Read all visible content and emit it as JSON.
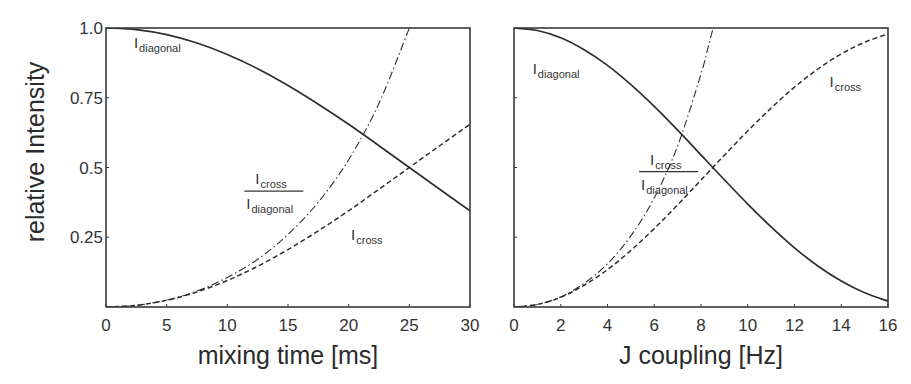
{
  "figure": {
    "ylabel": "relative Intensity",
    "colors": {
      "line": "#2e2e2e",
      "frame": "#3a3a3a",
      "background": "#ffffff"
    }
  },
  "chart_data": [
    {
      "type": "line",
      "title": "",
      "xlabel": "mixing time [ms]",
      "ylabel": "relative Intensity",
      "xlim": [
        0,
        30
      ],
      "ylim": [
        0,
        1.0
      ],
      "xticks": [
        0,
        5,
        10,
        15,
        20,
        25,
        30
      ],
      "xtick_labels": [
        "0",
        "5",
        "10",
        "15",
        "20",
        "25",
        "30"
      ],
      "yticks": [
        0.25,
        0.5,
        0.75,
        1.0
      ],
      "ytick_labels": [
        "0.25",
        "0.5",
        "0.75",
        "1.0"
      ],
      "grid": false,
      "legend": "inline labels",
      "series": [
        {
          "name": "I_diagonal",
          "style": "solid",
          "x": [
            0,
            2.5,
            5,
            7.5,
            10,
            12.5,
            15,
            17.5,
            20,
            22.5,
            25,
            27.5,
            30
          ],
          "y": [
            1.0,
            0.994,
            0.976,
            0.946,
            0.905,
            0.854,
            0.794,
            0.727,
            0.655,
            0.578,
            0.5,
            0.422,
            0.345
          ]
        },
        {
          "name": "I_cross",
          "style": "dashed",
          "x": [
            0,
            2.5,
            5,
            7.5,
            10,
            12.5,
            15,
            17.5,
            20,
            22.5,
            25,
            27.5,
            30
          ],
          "y": [
            0.0,
            0.006,
            0.024,
            0.054,
            0.095,
            0.146,
            0.206,
            0.273,
            0.345,
            0.422,
            0.5,
            0.578,
            0.655
          ]
        },
        {
          "name": "I_cross / I_diagonal",
          "style": "dashdot",
          "x": [
            0,
            2.5,
            5,
            7.5,
            10,
            12.5,
            15,
            17.5,
            20,
            22.5,
            25
          ],
          "y": [
            0.0,
            0.006,
            0.025,
            0.057,
            0.106,
            0.171,
            0.26,
            0.376,
            0.528,
            0.73,
            1.0
          ]
        }
      ],
      "annotations": [
        {
          "id": "diag",
          "text": "I",
          "sub": "diagonal",
          "x": 2.3,
          "y": 0.93
        },
        {
          "id": "cross",
          "text": "I",
          "sub": "cross",
          "x": 20.2,
          "y": 0.24
        },
        {
          "id": "ratio",
          "num": "I",
          "num_sub": "cross",
          "den": "I",
          "den_sub": "diagonal",
          "x": 11.4,
          "y": 0.415
        }
      ]
    },
    {
      "type": "line",
      "title": "",
      "xlabel": "J coupling [Hz]",
      "ylabel": "",
      "xlim": [
        0,
        16
      ],
      "ylim": [
        0,
        1.0
      ],
      "xticks": [
        0,
        2,
        4,
        6,
        8,
        10,
        12,
        14,
        16
      ],
      "xtick_labels": [
        "0",
        "2",
        "4",
        "6",
        "8",
        "10",
        "12",
        "14",
        "16"
      ],
      "yticks": [
        0.25,
        0.5,
        0.75,
        1.0
      ],
      "ytick_labels": [],
      "grid": false,
      "legend": "inline labels",
      "series": [
        {
          "name": "I_diagonal",
          "style": "solid",
          "x": [
            0,
            1,
            2,
            3,
            4,
            5,
            6,
            7,
            8,
            9,
            10,
            11,
            12,
            13,
            14,
            15,
            16
          ],
          "y": [
            1.0,
            0.991,
            0.965,
            0.922,
            0.866,
            0.797,
            0.719,
            0.634,
            0.545,
            0.456,
            0.369,
            0.287,
            0.212,
            0.147,
            0.093,
            0.051,
            0.021
          ]
        },
        {
          "name": "I_cross",
          "style": "dashed",
          "x": [
            0,
            1,
            2,
            3,
            4,
            5,
            6,
            7,
            8,
            9,
            10,
            11,
            12,
            13,
            14,
            15,
            16
          ],
          "y": [
            0.0,
            0.009,
            0.035,
            0.078,
            0.134,
            0.203,
            0.281,
            0.366,
            0.455,
            0.544,
            0.631,
            0.713,
            0.788,
            0.853,
            0.907,
            0.949,
            0.979
          ]
        },
        {
          "name": "I_cross / I_diagonal",
          "style": "dashdot",
          "x": [
            0,
            1,
            2,
            3,
            4,
            5,
            6,
            7,
            8,
            8.3
          ],
          "y": [
            0.0,
            0.009,
            0.036,
            0.085,
            0.155,
            0.255,
            0.391,
            0.577,
            0.835,
            0.93
          ]
        }
      ],
      "annotations": [
        {
          "id": "diag",
          "text": "I",
          "sub": "diagonal",
          "x": 0.8,
          "y": 0.835
        },
        {
          "id": "cross",
          "text": "I",
          "sub": "cross",
          "x": 13.5,
          "y": 0.79
        },
        {
          "id": "ratio",
          "num": "I",
          "num_sub": "cross",
          "den": "I",
          "den_sub": "diagonal",
          "x": 5.35,
          "y": 0.485
        }
      ]
    }
  ]
}
